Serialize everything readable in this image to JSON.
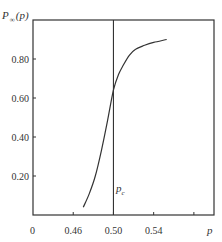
{
  "chart_data": {
    "type": "line",
    "title": "",
    "xlabel": "p",
    "ylabel": "P_∞(p)",
    "ylabel_main": "P",
    "ylabel_sub": "∞",
    "ylabel_arg": "(p)",
    "xlim": [
      0.42,
      0.6
    ],
    "ylim": [
      0,
      1.0
    ],
    "x_origin_label": "0",
    "x_ticks": [
      {
        "value": 0.46,
        "label": "0.46"
      },
      {
        "value": 0.5,
        "label": "0.50"
      },
      {
        "value": 0.54,
        "label": "0.54"
      },
      {
        "value": 0.58,
        "label": ""
      }
    ],
    "y_ticks": [
      {
        "value": 0.2,
        "label": "0.20"
      },
      {
        "value": 0.4,
        "label": "0.40"
      },
      {
        "value": 0.6,
        "label": "0.60"
      },
      {
        "value": 0.8,
        "label": "0.80"
      }
    ],
    "grid": false,
    "legend": null,
    "series": [
      {
        "name": "P_∞(p)",
        "x": [
          0.47,
          0.476,
          0.482,
          0.488,
          0.494,
          0.5,
          0.505,
          0.51,
          0.516,
          0.522,
          0.531,
          0.54,
          0.553
        ],
        "y": [
          0.04,
          0.11,
          0.2,
          0.33,
          0.48,
          0.64,
          0.72,
          0.77,
          0.82,
          0.85,
          0.87,
          0.885,
          0.9
        ]
      }
    ],
    "annotations": [
      {
        "type": "vline",
        "x": 0.5,
        "label": "p",
        "label_sub": "c"
      }
    ]
  }
}
